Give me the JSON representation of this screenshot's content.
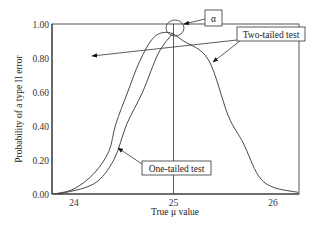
{
  "chart_data": {
    "type": "line",
    "title": "",
    "xlabel": "True μ value",
    "ylabel": "Probability of a type II error",
    "xlim": [
      23.78,
      26.26
    ],
    "ylim": [
      0,
      1.0
    ],
    "x_ticks": [
      24,
      25,
      26
    ],
    "x_tick_labels": [
      "24",
      "25",
      "26"
    ],
    "y_ticks": [
      0,
      0.2,
      0.4,
      0.6,
      0.8,
      1.0
    ],
    "y_tick_labels": [
      "0.00",
      "0.20",
      "0.40",
      "0.60",
      "0.80",
      "1.00"
    ],
    "grid": false,
    "reference_line_x": 25,
    "series": [
      {
        "name": "Two-tailed test",
        "x": [
          23.8,
          24.0,
          24.2,
          24.35,
          24.42,
          24.54,
          24.66,
          24.8,
          24.95,
          25.1,
          25.35,
          25.55,
          25.7,
          25.85,
          26.0,
          26.25
        ],
        "y": [
          0.0,
          0.03,
          0.12,
          0.25,
          0.41,
          0.6,
          0.78,
          0.92,
          0.95,
          0.9,
          0.79,
          0.46,
          0.3,
          0.11,
          0.04,
          0.01
        ]
      },
      {
        "name": "One-tailed test",
        "x": [
          23.85,
          24.2,
          24.4,
          24.53,
          24.69,
          24.85,
          25.0
        ],
        "y": [
          0.0,
          0.06,
          0.2,
          0.41,
          0.6,
          0.83,
          0.95
        ]
      }
    ],
    "annotations": [
      {
        "label": "α",
        "target": "gap between 1.00 and curve peak at μ = 25",
        "marker": "circle"
      },
      {
        "label": "Two-tailed test",
        "target_series": "Two-tailed test"
      },
      {
        "label": "One-tailed test",
        "target_series": "One-tailed test"
      }
    ]
  }
}
